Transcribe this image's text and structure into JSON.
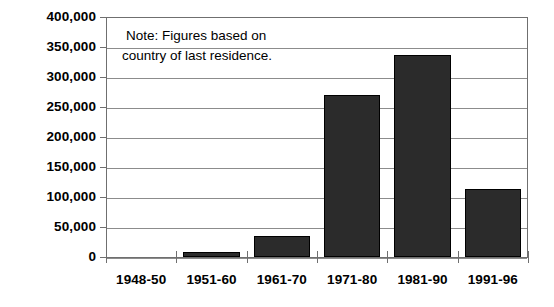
{
  "chart_data": {
    "type": "bar",
    "title": "",
    "subtitle": "",
    "xlabel": "",
    "ylabel": "",
    "categories": [
      "1948-50",
      "1951-60",
      "1961-70",
      "1971-80",
      "1981-90",
      "1991-96"
    ],
    "values": [
      0,
      8000,
      35000,
      270000,
      337000,
      113000
    ],
    "series": [
      {
        "name": "Immigrants",
        "values": [
          0,
          8000,
          35000,
          270000,
          337000,
          113000
        ]
      }
    ],
    "ylim": [
      0,
      400000
    ],
    "y_tick_values": [
      0,
      50000,
      100000,
      150000,
      200000,
      250000,
      300000,
      350000,
      400000
    ],
    "y_tick_labels": [
      "0",
      "50,000",
      "100,000",
      "150,000",
      "200,000",
      "250,000",
      "300,000",
      "350,000",
      "400,000"
    ],
    "grid": true,
    "grid_axis": "y",
    "legend": false,
    "legend_position": "none",
    "bar_color": "#2b2b2b",
    "bar_edge_color": "#000000",
    "grid_color": "#8c8c8c",
    "axis_color": "#6f6f6f",
    "background_color": "#ffffff",
    "annotations": [
      {
        "name": "note",
        "line_1": "Note: Figures based on",
        "line_2": "country of last residence."
      }
    ]
  }
}
